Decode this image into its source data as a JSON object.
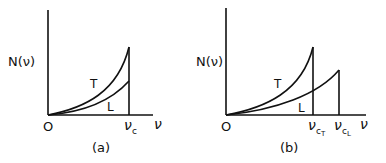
{
  "panels": [
    {
      "id": "a",
      "caption": "(a)",
      "y_label": "N(ν)",
      "x_label": "ν",
      "origin_label": "O",
      "curves": [
        {
          "name": "T",
          "label": "T",
          "cutoff": "ν_c"
        },
        {
          "name": "L",
          "label": "L",
          "cutoff": "ν_c"
        }
      ],
      "cutoff_labels": [
        {
          "base": "ν",
          "sub": "c"
        }
      ]
    },
    {
      "id": "b",
      "caption": "(b)",
      "y_label": "N(ν)",
      "x_label": "ν",
      "origin_label": "O",
      "curves": [
        {
          "name": "T",
          "label": "T",
          "cutoff": "ν_cT"
        },
        {
          "name": "L",
          "label": "L",
          "cutoff": "ν_cL"
        }
      ],
      "cutoff_labels": [
        {
          "base": "ν",
          "sub": "c",
          "subsub": "T"
        },
        {
          "base": "ν",
          "sub": "c",
          "subsub": "L"
        }
      ]
    }
  ],
  "colors": {
    "ink": "#111111",
    "background": "#ffffff"
  }
}
